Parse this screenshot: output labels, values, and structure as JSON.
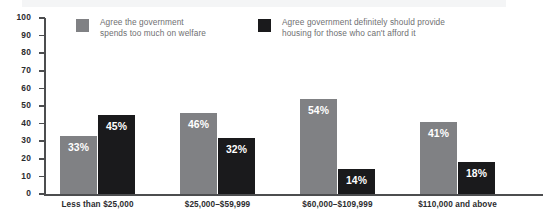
{
  "chart_data": {
    "type": "bar",
    "title": "",
    "subtitle": "",
    "xlabel": "",
    "ylabel": "",
    "ylim": [
      0,
      100
    ],
    "yticks": [
      0,
      10,
      20,
      30,
      40,
      50,
      60,
      70,
      80,
      90,
      100
    ],
    "grid": false,
    "legend_position": "top",
    "categories": [
      "Less than $25,000",
      "$25,000–$59,999",
      "$60,000–$109,999",
      "$110,000 and above"
    ],
    "series": [
      {
        "name": "Agree the government\nspends too much on welfare",
        "color": "#808184",
        "values": [
          33,
          46,
          54,
          41
        ],
        "labels": [
          "33%",
          "46%",
          "54%",
          "41%"
        ]
      },
      {
        "name": "Agree government definitely should provide\nhousing for those who can't afford it",
        "color": "#1a1a1c",
        "values": [
          45,
          32,
          14,
          18
        ],
        "labels": [
          "45%",
          "32%",
          "14%",
          "18%"
        ]
      }
    ]
  },
  "axis": {
    "y_tick_labels": [
      "100",
      "90",
      "80",
      "70",
      "60",
      "50",
      "40",
      "30",
      "20",
      "10",
      "0"
    ],
    "axis_color": "#4c4d4f",
    "tick_label_color": "#2b2c2e"
  },
  "legend": {
    "items": [
      {
        "label": "Agree the government\nspends too much on welfare",
        "color": "#808184"
      },
      {
        "label": "Agree government definitely should provide\nhousing for those who can't afford it",
        "color": "#1a1a1c"
      }
    ],
    "text_color": "#6f7072"
  }
}
